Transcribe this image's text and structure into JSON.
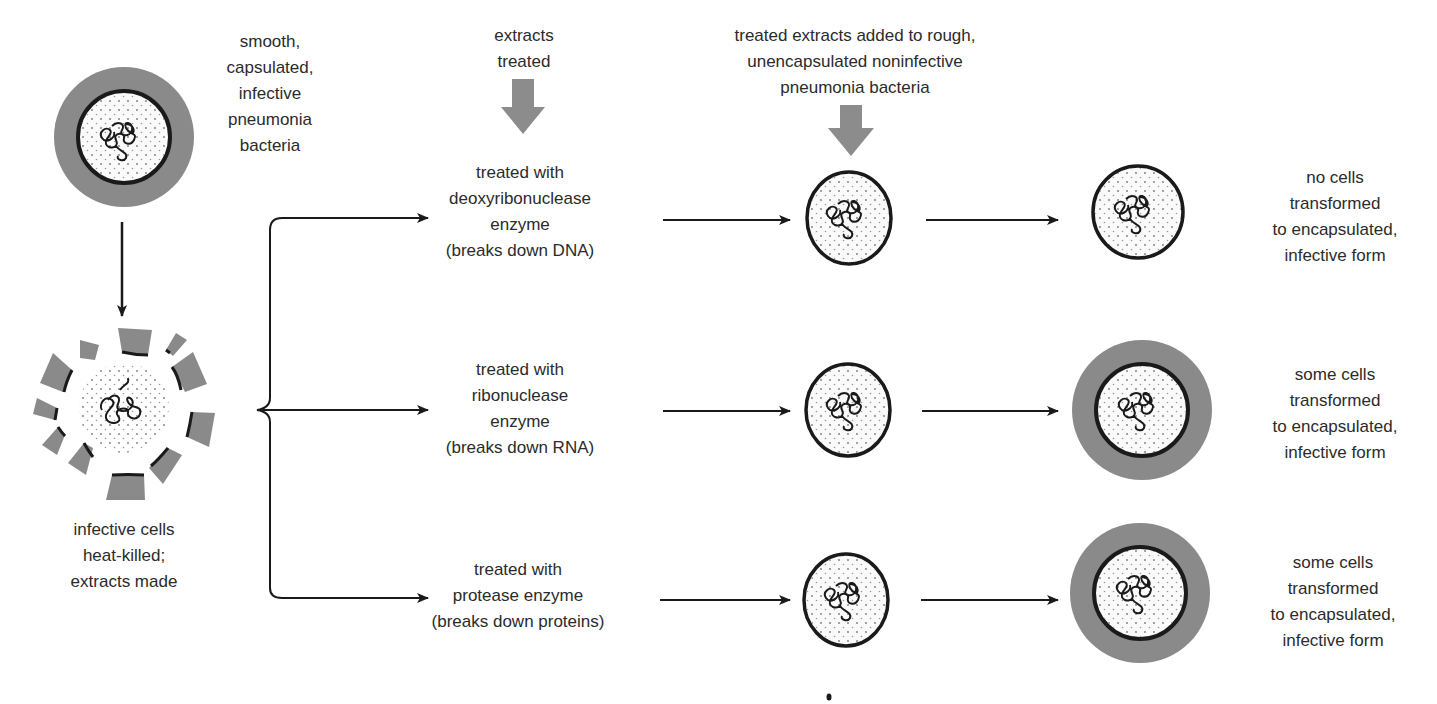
{
  "colors": {
    "capsule": "#8a8a8a",
    "outline": "#1a1a1a",
    "cytoplasm": "#fafafa",
    "big_arrow": "#8c8c8c",
    "text": "#2b2b2b"
  },
  "start": {
    "label_lines": [
      "smooth,",
      "capsulated,",
      "infective",
      "pneumonia",
      "bacteria"
    ]
  },
  "heat_killed": {
    "label_lines": [
      "infective cells",
      "heat-killed;",
      "extracts made"
    ]
  },
  "extracts_treated": {
    "label_lines": [
      "extracts",
      "treated"
    ]
  },
  "added_to_rough": {
    "label_lines": [
      "treated extracts added to rough,",
      "unencapsulated noninfective",
      "pneumonia bacteria"
    ]
  },
  "rows": [
    {
      "treatment_lines": [
        "treated with",
        "deoxyribonuclease",
        "enzyme",
        "(breaks down DNA)"
      ],
      "result_capsule": false,
      "result_lines": [
        "no cells",
        "transformed",
        "to encapsulated,",
        "infective form"
      ]
    },
    {
      "treatment_lines": [
        "treated with",
        "ribonuclease",
        "enzyme",
        "(breaks down RNA)"
      ],
      "result_capsule": true,
      "result_lines": [
        "some cells",
        "transformed",
        "to encapsulated,",
        "infective form"
      ]
    },
    {
      "treatment_lines": [
        "treated with",
        "protease enzyme",
        "(breaks down proteins)"
      ],
      "result_capsule": true,
      "result_lines": [
        "some cells",
        "transformed",
        "to encapsulated,",
        "infective form"
      ]
    }
  ]
}
